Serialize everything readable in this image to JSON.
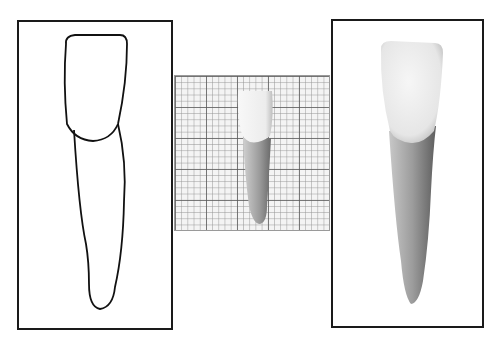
{
  "figure": {
    "panels": [
      {
        "id": "outline",
        "style": "line-drawing"
      },
      {
        "id": "grid-photo",
        "style": "photograph-on-graph-paper"
      },
      {
        "id": "shaded",
        "style": "shaded-illustration"
      }
    ],
    "colors": {
      "frame": "#1a1a1a",
      "grid_major": "#5a5a5a",
      "grid_minor": "#969696",
      "crown": "#f2f2f2",
      "root": "#9a9a9a"
    },
    "caption": ""
  }
}
